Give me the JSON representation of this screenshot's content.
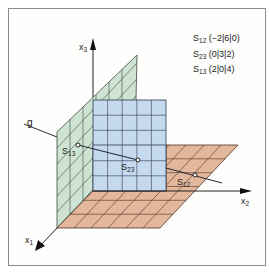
{
  "diagram": {
    "type": "3d-coordinate-system",
    "axes": {
      "x1": {
        "label": "x",
        "sub": "1"
      },
      "x2": {
        "label": "x",
        "sub": "2"
      },
      "x3": {
        "label": "x",
        "sub": "3"
      }
    },
    "line_label": "g",
    "planes": [
      {
        "name": "x1x3-plane",
        "color": "#cfe3d3"
      },
      {
        "name": "x2x3-plane",
        "color": "#c5d9ef"
      },
      {
        "name": "x1x2-plane",
        "color": "#e3b79b"
      }
    ],
    "points": [
      {
        "id": "S12",
        "label": "S",
        "sub": "12"
      },
      {
        "id": "S23",
        "label": "S",
        "sub": "23"
      },
      {
        "id": "S13",
        "label": "S",
        "sub": "13"
      }
    ],
    "legend": [
      {
        "label": "S",
        "sub": "12",
        "coords": "(−2|6|0)"
      },
      {
        "label": "S",
        "sub": "23",
        "coords": "(0|3|2)"
      },
      {
        "label": "S",
        "sub": "13",
        "coords": "(2|0|4)"
      }
    ]
  }
}
